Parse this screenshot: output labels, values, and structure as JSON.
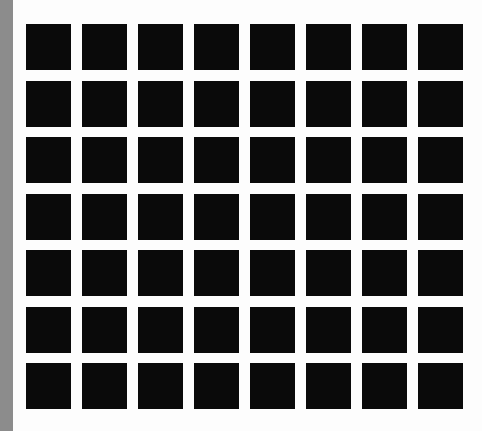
{
  "image": {
    "description": "Hermann grid illusion: black squares on white background",
    "rows": 7,
    "columns": 8,
    "colors": {
      "square": "#0a0a0a",
      "background": "#fdfdfd",
      "left_strip": "#8c8c8c"
    }
  }
}
